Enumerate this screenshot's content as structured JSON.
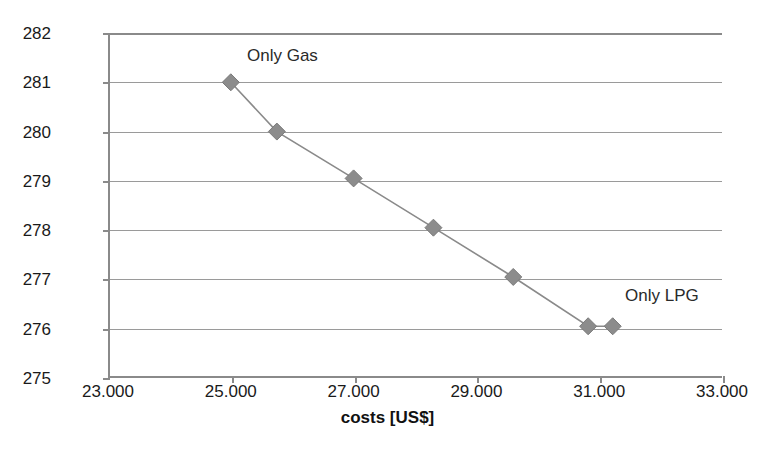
{
  "chart_data": {
    "type": "line",
    "title": "",
    "xlabel": "costs [US$]",
    "ylabel": "emissions [tCO2]",
    "ylabel_base": "emissions [tCO",
    "ylabel_sub": "2",
    "ylabel_tail": "]",
    "xlim": [
      23000,
      33000
    ],
    "ylim": [
      275,
      282
    ],
    "xtick_step": 2000,
    "ytick_step": 1,
    "grid": true,
    "legend": false,
    "marker": "diamond",
    "marker_color": "#8c8c8c",
    "line_color": "#8a8a8a",
    "axis_color": "#8a8a8a",
    "grid_color": "#9a9a9a",
    "text_color": "#1a1a1a",
    "xticks": [
      {
        "value": 23000,
        "label": "23.000"
      },
      {
        "value": 25000,
        "label": "25.000"
      },
      {
        "value": 27000,
        "label": "27.000"
      },
      {
        "value": 29000,
        "label": "29.000"
      },
      {
        "value": 31000,
        "label": "31.000"
      },
      {
        "value": 33000,
        "label": "33.000"
      }
    ],
    "yticks": [
      {
        "value": 282,
        "label": "282"
      },
      {
        "value": 281,
        "label": "281"
      },
      {
        "value": 280,
        "label": "280"
      },
      {
        "value": 279,
        "label": "279"
      },
      {
        "value": 278,
        "label": "278"
      },
      {
        "value": 277,
        "label": "277"
      },
      {
        "value": 276,
        "label": "276"
      },
      {
        "value": 275,
        "label": "275"
      }
    ],
    "series": [
      {
        "name": "cost-emissions tradeoff",
        "x": [
          25000,
          25750,
          27000,
          28300,
          29600,
          30820,
          31220
        ],
        "y": [
          281.0,
          280.0,
          279.05,
          278.05,
          277.05,
          276.05,
          276.05
        ]
      }
    ],
    "annotations": [
      {
        "text": "Only Gas",
        "x": 26000,
        "y": 281.7
      },
      {
        "text": "Only LPG",
        "x": 31400,
        "y": 276.8
      }
    ]
  }
}
